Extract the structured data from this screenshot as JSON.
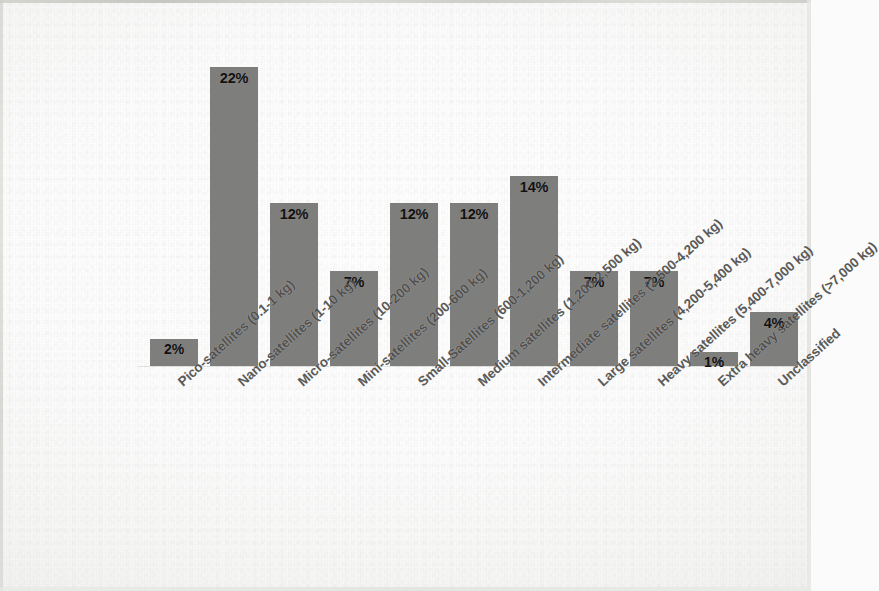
{
  "chart_data": {
    "type": "bar",
    "title": "",
    "subtitle": "",
    "xlabel": "",
    "ylabel": "",
    "ylim": [
      0,
      24
    ],
    "grid": false,
    "legend": false,
    "orientation": "vertical",
    "bar_color": "#7e7e7c",
    "background_color": "#fbfbfb",
    "label_color": "#4d4d4b",
    "value_label_color": "#111111",
    "value_label_position": "inside-top",
    "value_label_suffix": "%",
    "categories": [
      "Pico-satellites (0.1-1 kg)",
      "Nano-satellites (1-10 kg)",
      "Micro-satellites (10-200 kg)",
      "Mini-satellites (200-600 kg)",
      "Small-Satellites (600-1,200 kg)",
      "Medium satellites (1,200-2,500 kg)",
      "Intermediate satellites (2,500-4,200 kg)",
      "Large satellites (4,200-5,400 kg)",
      "Heavy satellites (5,400-7,000 kg)",
      "Extra heavy satellites (>7,000 kg)",
      "Unclassified"
    ],
    "values": [
      2,
      22,
      12,
      7,
      12,
      12,
      14,
      7,
      7,
      1,
      4
    ],
    "value_labels": [
      "2%",
      "22%",
      "12%",
      "7%",
      "12%",
      "12%",
      "14%",
      "7%",
      "7%",
      "1%",
      "4%"
    ]
  }
}
